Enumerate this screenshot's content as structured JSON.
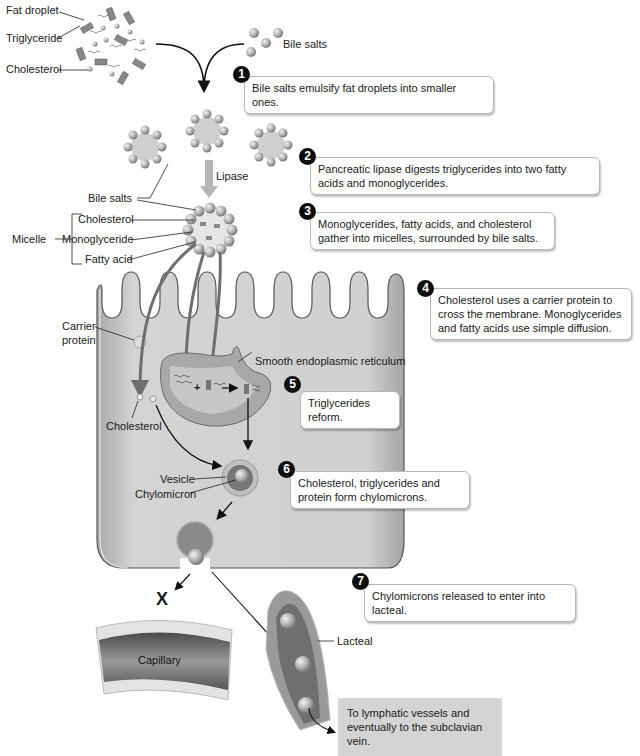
{
  "diagram": {
    "top_labels": {
      "fat_droplet": "Fat droplet",
      "triglyceride": "Triglyceride",
      "cholesterol": "Cholesterol",
      "bile_salts": "Bile salts",
      "lipase": "Lipase"
    },
    "micelle_labels": {
      "bile_salts": "Bile salts",
      "micelle": "Micelle",
      "cholesterol": "Cholesterol",
      "monoglyceride": "Monoglyceride",
      "fatty_acid": "Fatty acid"
    },
    "cell_labels": {
      "carrier_protein_line1": "Carrier",
      "carrier_protein_line2": "protein",
      "smooth_er": "Smooth endoplasmic reticulum",
      "cholesterol": "Cholesterol",
      "vesicle": "Vesicle",
      "chylomicron": "Chylomicron",
      "plus": "+"
    },
    "vessel_labels": {
      "blocked": "X",
      "capillary": "Capillary",
      "lacteal": "Lacteal"
    },
    "steps": [
      {
        "number": "1",
        "text": "Bile salts emulsify fat droplets into smaller ones."
      },
      {
        "number": "2",
        "text": "Pancreatic lipase digests triglycerides into two fatty acids and monoglycerides."
      },
      {
        "number": "3",
        "text": "Monoglycerides, fatty acids, and cholesterol gather into micelles, surrounded by bile salts."
      },
      {
        "number": "4",
        "text": "Cholesterol uses a carrier protein to cross the membrane. Monoglycerides and fatty acids use simple diffusion."
      },
      {
        "number": "5",
        "text": "Triglycerides reform."
      },
      {
        "number": "6",
        "text": "Cholesterol, triglycerides and protein form chylomicrons."
      },
      {
        "number": "7",
        "text": "Chylomicrons released to enter into lacteal."
      }
    ],
    "destination_note": "To lymphatic vessels and eventually to the subclavian vein.",
    "colors": {
      "cell_fill": "#c9c9c9",
      "er_fill": "#a8a8a8",
      "sphere": "#b5b5b5",
      "arrow": "#6e6e6e",
      "lacteal": "#8a8a8a",
      "capillary": "#6a6a6a",
      "note_bg": "#d4d4d4"
    }
  }
}
